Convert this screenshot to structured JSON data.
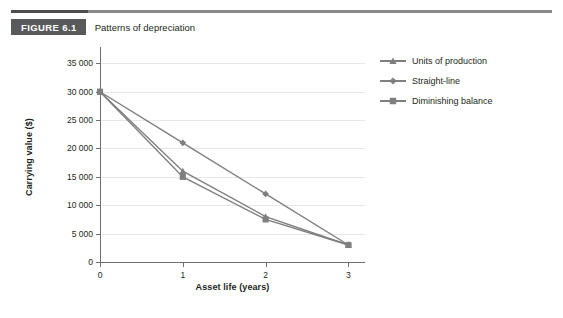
{
  "figure": {
    "number": "FIGURE 6.1",
    "title": "Patterns of depreciation"
  },
  "chart_data": {
    "type": "line",
    "title": "Patterns of depreciation",
    "xlabel": "Asset life (years)",
    "ylabel": "Carrying value ($)",
    "x": [
      0,
      1,
      2,
      3
    ],
    "xticklabels": [
      "0",
      "1",
      "2",
      "3"
    ],
    "xlim": [
      0,
      3.2
    ],
    "ylim": [
      0,
      37000
    ],
    "yticks": [
      0,
      5000,
      10000,
      15000,
      20000,
      25000,
      30000,
      35000
    ],
    "yticklabels": [
      "0",
      "5 000",
      "10 000",
      "15 000",
      "20 000",
      "25 000",
      "30 000",
      "35 000"
    ],
    "grid": "horizontal",
    "legend_position": "right",
    "series": [
      {
        "name": "Units of production",
        "marker": "triangle",
        "color": "#7f7f7f",
        "values": [
          30000,
          16000,
          8000,
          3000
        ]
      },
      {
        "name": "Straight-line",
        "marker": "diamond",
        "color": "#7f7f7f",
        "values": [
          30000,
          21000,
          12000,
          3000
        ]
      },
      {
        "name": "Diminishing balance",
        "marker": "square",
        "color": "#7f7f7f",
        "values": [
          30000,
          15000,
          7500,
          3000
        ]
      }
    ]
  },
  "colors": {
    "series": "#7f7f7f",
    "axis": "#6f6f6f",
    "gridline": "#e8e8e8",
    "caption_box": "#58595b",
    "rule": "#8a8a8a",
    "rule_accent": "#4d4d4d"
  }
}
